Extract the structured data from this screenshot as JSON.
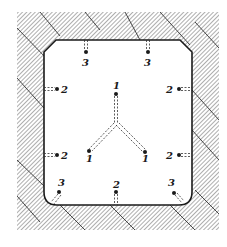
{
  "diagram": {
    "title": "",
    "colors": {
      "ink": "#1a1a1a",
      "hatch": "#555555",
      "background": "#ffffff"
    },
    "holes": [
      {
        "id": "top-left",
        "label": "3",
        "dot": [
          86,
          52
        ],
        "label_pos": [
          83,
          64
        ],
        "dir": "up"
      },
      {
        "id": "top-right",
        "label": "3",
        "dot": [
          148,
          52
        ],
        "label_pos": [
          145,
          64
        ],
        "dir": "up"
      },
      {
        "id": "left-upper",
        "label": "2",
        "dot": [
          57,
          89
        ],
        "label_pos": [
          62,
          93
        ],
        "dir": "left"
      },
      {
        "id": "left-lower",
        "label": "2",
        "dot": [
          57,
          155
        ],
        "label_pos": [
          62,
          159
        ],
        "dir": "left"
      },
      {
        "id": "right-upper",
        "label": "2",
        "dot": [
          179,
          89
        ],
        "label_pos": [
          166,
          93
        ],
        "dir": "right"
      },
      {
        "id": "right-lower",
        "label": "2",
        "dot": [
          179,
          155
        ],
        "label_pos": [
          166,
          159
        ],
        "dir": "right"
      },
      {
        "id": "center-top",
        "label": "1",
        "dot": [
          116,
          94
        ],
        "label_pos": [
          113,
          87
        ],
        "dir": "down"
      },
      {
        "id": "center-left",
        "label": "1",
        "dot": [
          89,
          151
        ],
        "label_pos": [
          86,
          163
        ],
        "dir": "up-right"
      },
      {
        "id": "center-right",
        "label": "1",
        "dot": [
          145,
          152
        ],
        "label_pos": [
          142,
          164
        ],
        "dir": "up-left"
      },
      {
        "id": "bottom-center",
        "label": "2",
        "dot": [
          116,
          192
        ],
        "label_pos": [
          113,
          186
        ],
        "dir": "down"
      },
      {
        "id": "bottom-left",
        "label": "3",
        "dot": [
          59,
          192
        ],
        "label_pos": [
          58,
          184
        ],
        "dir": "down-left"
      },
      {
        "id": "bottom-right",
        "label": "3",
        "dot": [
          174,
          193
        ],
        "label_pos": [
          168,
          184
        ],
        "dir": "down-right"
      }
    ],
    "labels": {
      "top_left": "3",
      "top_right": "3",
      "left_upper": "2",
      "left_lower": "2",
      "right_upper": "2",
      "right_lower": "2",
      "center_top": "1",
      "center_left": "1",
      "center_right": "1",
      "bottom_center": "2",
      "bottom_left": "3",
      "bottom_right": "3"
    }
  }
}
